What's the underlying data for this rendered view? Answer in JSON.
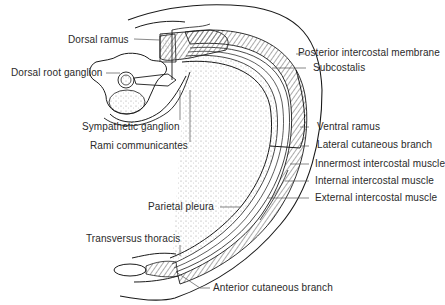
{
  "figure": {
    "labels": {
      "dorsal_ramus": "Dorsal ramus",
      "dorsal_root_ganglion": "Dorsal root ganglion",
      "sympathetic_ganglion": "Sympathetic ganglion",
      "rami_communicantes": "Rami communicantes",
      "posterior_intercostal_membrane": "Posterior intercostal membrane",
      "subcostalis": "Subcostalis",
      "ventral_ramus": "Ventral ramus",
      "lateral_cutaneous_branch": "Lateral cutaneous branch",
      "innermost_intercostal_muscle": "Innermost intercostal muscle",
      "internal_intercostal_muscle": "Internal intercostal muscle",
      "external_intercostal_muscle": "External intercostal muscle",
      "parietal_pleura": "Parietal pleura",
      "transversus_thoracis": "Transversus thoracis",
      "anterior_cutaneous_branch": "Anterior cutaneous branch",
      "sternum_text": "sternum"
    },
    "colors": {
      "line": "#1a1a1a",
      "text": "#2a2a2a",
      "background": "#ffffff",
      "hatch": "#555555"
    }
  }
}
